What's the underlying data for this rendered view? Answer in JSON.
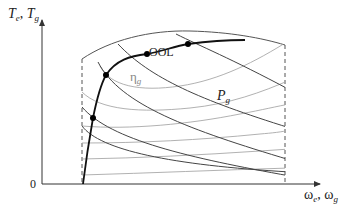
{
  "axes": {
    "y_label_main": "T",
    "y_label_sub1": "e",
    "y_label_sep": ", ",
    "y_label_main2": "T",
    "y_label_sub2": "g",
    "x_label_main": "ω",
    "x_label_sub1": "e",
    "x_label_sep": ", ",
    "x_label_main2": "ω",
    "x_label_sub2": "g",
    "origin": "0"
  },
  "annotations": {
    "ool": "OOL",
    "eta_main": "η",
    "eta_sub": "g",
    "power_main": "P",
    "power_sub": "g"
  },
  "colors": {
    "axis": "#333333",
    "ool_curve": "#111111",
    "power_curves": "#444444",
    "efficiency_curves": "#a8a8a8",
    "boundary": "#555555",
    "dashed_limits": "#555555",
    "points": "#000000"
  },
  "elements": {
    "boundary_upper": "maximum torque envelope",
    "limit_left": "minimum speed limit (dashed)",
    "limit_right": "maximum speed limit (dashed)",
    "ool_points_count": 4,
    "power_curve_count": 5,
    "efficiency_curve_count": 6
  }
}
